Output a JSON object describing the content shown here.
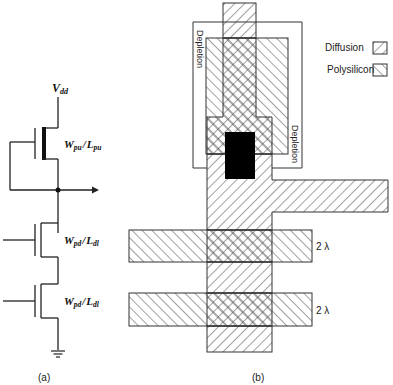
{
  "figure": {
    "caption_a": "(a)",
    "caption_b": "(b)"
  },
  "circuit": {
    "supply_label_main": "V",
    "supply_label_sub": "dd",
    "pullup": {
      "w_main": "W",
      "w_sub": "pu",
      "sep": "/",
      "l_main": "L",
      "l_sub": "pu",
      "type": "depletion"
    },
    "pulldowns": [
      {
        "w_main": "W",
        "w_sub": "pd",
        "sep": "/",
        "l_main": "L",
        "l_sub": "dl",
        "type": "enhancement"
      },
      {
        "w_main": "W",
        "w_sub": "pd",
        "sep": "/",
        "l_main": "L",
        "l_sub": "dl",
        "type": "enhancement"
      }
    ],
    "ground_symbol": "ground-icon"
  },
  "layout": {
    "depletion_label_left": "Depletion",
    "depletion_label_right": "Depletion",
    "dimension_labels": [
      "2 λ",
      "2 λ"
    ],
    "legend": [
      {
        "label": "Diffusion",
        "pattern": "diffusion-hatch"
      },
      {
        "label": "Polysilicon",
        "pattern": "polysilicon-hatch"
      }
    ],
    "colors": {
      "line": "#333333",
      "contact": "#000000",
      "background": "#ffffff"
    }
  }
}
